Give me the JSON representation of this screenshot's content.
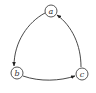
{
  "diagram": {
    "type": "directed-cycle-graph",
    "nodes": [
      {
        "id": "a",
        "label": "a",
        "cx": 51,
        "cy": 11
      },
      {
        "id": "b",
        "label": "b",
        "cx": 17,
        "cy": 73
      },
      {
        "id": "c",
        "label": "c",
        "cx": 82,
        "cy": 74
      }
    ],
    "edges": [
      {
        "from": "a",
        "to": "b"
      },
      {
        "from": "b",
        "to": "c"
      },
      {
        "from": "c",
        "to": "a"
      }
    ],
    "colors": {
      "stroke": "#333333",
      "background": "#ffffff"
    }
  }
}
